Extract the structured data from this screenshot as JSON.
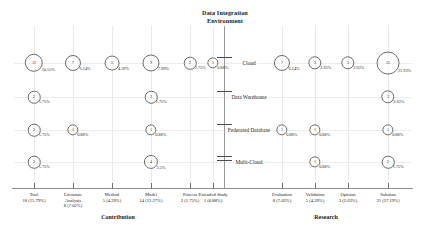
{
  "chart_data": {
    "type": "heatmap",
    "title": "Data Integration Environment",
    "title_lines": [
      "Data Integration",
      "Environment"
    ],
    "xlabel": "",
    "ylabel": "",
    "grid": true,
    "legend_position": "none",
    "group_labels": [
      "Contribution",
      "Research"
    ],
    "categories": [
      "Tool",
      "Literature Analysis",
      "Method",
      "Model",
      "Process",
      "Extended Study",
      "Evaluation",
      "Validation",
      "Opinion",
      "Solution"
    ],
    "rows": [
      "Cloud",
      "Data Warehouse",
      "Federated Database",
      "Multi-Cloud"
    ],
    "column_totals": [
      {
        "label_lines": [
          "Tool"
        ],
        "count": 18,
        "percent": "15.79%",
        "total_text": "18 (15.79%)",
        "group": "Contribution"
      },
      {
        "label_lines": [
          "Literature",
          "Analysis"
        ],
        "count": 8,
        "percent": "7.02%",
        "total_text": "8 (7.02%)",
        "group": "Contribution"
      },
      {
        "label_lines": [
          "Method"
        ],
        "count": 5,
        "percent": "4.39%",
        "total_text": "5 (4.39%)",
        "group": "Contribution"
      },
      {
        "label_lines": [
          "Model"
        ],
        "count": 14,
        "percent": "12.27%",
        "total_text": "14 (12.27%)",
        "group": "Contribution"
      },
      {
        "label_lines": [
          "Process"
        ],
        "count": 2,
        "percent": "1.75%",
        "total_text": "2 (1.75%)",
        "group": "Contribution"
      },
      {
        "label_lines": [
          "Extended Study"
        ],
        "count": 1,
        "percent": "0.88%",
        "total_text": "1 (0.88%)",
        "group": "Contribution"
      },
      {
        "label_lines": [
          "Evaluation"
        ],
        "count": 8,
        "percent": "7.02%",
        "total_text": "8 (7.02%)",
        "group": "Research"
      },
      {
        "label_lines": [
          "Validation"
        ],
        "count": 5,
        "percent": "4.39%",
        "total_text": "5 (4.39%)",
        "group": "Research"
      },
      {
        "label_lines": [
          "Opinion"
        ],
        "count": 3,
        "percent": "2.63%",
        "total_text": "3 (2.63%)",
        "group": "Research"
      },
      {
        "label_lines": [
          "Solution"
        ],
        "count": 31,
        "percent": "27.19%",
        "total_text": "31 (27.19%)",
        "group": "Research"
      }
    ],
    "bubbles": [
      {
        "row": "Cloud",
        "category": "Tool",
        "value": 12,
        "percent": "10.55%"
      },
      {
        "row": "Cloud",
        "category": "Literature Analysis",
        "value": 7,
        "percent": "6.14%"
      },
      {
        "row": "Cloud",
        "category": "Method",
        "value": 5,
        "percent": "4.39%"
      },
      {
        "row": "Cloud",
        "category": "Model",
        "value": 9,
        "percent": "7.89%"
      },
      {
        "row": "Cloud",
        "category": "Process",
        "value": 2,
        "percent": "1.75%"
      },
      {
        "row": "Cloud",
        "category": "Extended Study",
        "value": 1,
        "percent": "0.88%"
      },
      {
        "row": "Cloud",
        "category": "Evaluation",
        "value": 7,
        "percent": "6.14%"
      },
      {
        "row": "Cloud",
        "category": "Validation",
        "value": 3,
        "percent": "2.63%"
      },
      {
        "row": "Cloud",
        "category": "Opinion",
        "value": 3,
        "percent": "2.63%"
      },
      {
        "row": "Cloud",
        "category": "Solution",
        "value": 25,
        "percent": "21.93%"
      },
      {
        "row": "Data Warehouse",
        "category": "Tool",
        "value": 2,
        "percent": "1.75%"
      },
      {
        "row": "Data Warehouse",
        "category": "Model",
        "value": 2,
        "percent": "1.75%"
      },
      {
        "row": "Data Warehouse",
        "category": "Solution",
        "value": 3,
        "percent": "2.63%"
      },
      {
        "row": "Federated Database",
        "category": "Tool",
        "value": 2,
        "percent": "1.75%"
      },
      {
        "row": "Federated Database",
        "category": "Literature Analysis",
        "value": 1,
        "percent": "0.88%"
      },
      {
        "row": "Federated Database",
        "category": "Model",
        "value": 1,
        "percent": "0.88%"
      },
      {
        "row": "Federated Database",
        "category": "Evaluation",
        "value": 1,
        "percent": "0.88%"
      },
      {
        "row": "Federated Database",
        "category": "Validation",
        "value": 1,
        "percent": "0.88%"
      },
      {
        "row": "Federated Database",
        "category": "Solution",
        "value": 1,
        "percent": "0.88%"
      },
      {
        "row": "Multi-Cloud",
        "category": "Tool",
        "value": 2,
        "percent": "1.75%"
      },
      {
        "row": "Multi-Cloud",
        "category": "Model",
        "value": 4,
        "percent": "3.5%"
      },
      {
        "row": "Multi-Cloud",
        "category": "Validation",
        "value": 1,
        "percent": "0.88%"
      },
      {
        "row": "Multi-Cloud",
        "category": "Solution",
        "value": 2,
        "percent": "1.75%"
      }
    ]
  },
  "colors": {
    "bubble_stroke": "#6b6b6b",
    "axis": "#8d8d8d",
    "grid": "#ececed",
    "text": "#1a1a1a"
  }
}
